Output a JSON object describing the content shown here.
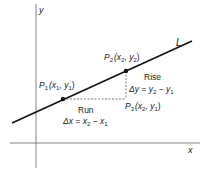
{
  "diagram": {
    "axes": {
      "x_label": "x",
      "y_label": "y"
    },
    "line_label": "L",
    "points": {
      "p1": {
        "name": "P",
        "sub": "1",
        "coords": "(x",
        "c1sub": "1",
        "mid": ", y",
        "c2sub": "1",
        "close": ")"
      },
      "p2": {
        "name": "P",
        "sub": "2",
        "coords": "(x",
        "c1sub": "2",
        "mid": ", y",
        "c2sub": "2",
        "close": ")"
      },
      "p3": {
        "name": "P",
        "sub": "3",
        "coords": "(x",
        "c1sub": "2",
        "mid": ", y",
        "c2sub": "1",
        "close": ")"
      }
    },
    "run": {
      "label": "Run",
      "formula_a": "Δx = x",
      "a_sub": "2",
      "formula_b": " − x",
      "b_sub": "1"
    },
    "rise": {
      "label": "Rise",
      "formula_a": "Δy = y",
      "a_sub": "2",
      "formula_b": " − y",
      "b_sub": "1"
    }
  }
}
